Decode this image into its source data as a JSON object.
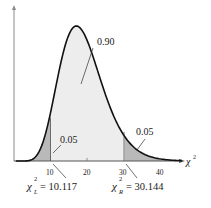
{
  "chart_data": {
    "type": "area",
    "title": "",
    "xlabel": "χ²",
    "ylabel": "",
    "distribution": "chi-square",
    "degrees_of_freedom": 19,
    "xlim": [
      0,
      45
    ],
    "x_ticks": [
      10,
      20,
      30,
      40
    ],
    "regions": [
      {
        "name": "left tail",
        "area": 0.05,
        "label": "0.05"
      },
      {
        "name": "middle",
        "area": 0.9,
        "label": "0.90"
      },
      {
        "name": "right tail",
        "area": 0.05,
        "label": "0.05"
      }
    ],
    "critical_values": [
      {
        "name": "chi2_L",
        "value": 10.117,
        "label": "χL² = 10.117"
      },
      {
        "name": "chi2_R",
        "value": 30.144,
        "label": "χR² = 30.144"
      }
    ]
  },
  "labels": {
    "middle": "0.90",
    "left_tail": "0.05",
    "right_tail": "0.05",
    "axis": "χ",
    "axis_sup": "2",
    "tick10": "10",
    "tick20": "20",
    "tick30": "30",
    "tick40": "40",
    "left_chi": "χ",
    "left_sub": "L",
    "left_sup": "2",
    "left_val": "= 10.117",
    "right_chi": "χ",
    "right_sub": "R",
    "right_sup": "2",
    "right_val": "= 30.144"
  }
}
